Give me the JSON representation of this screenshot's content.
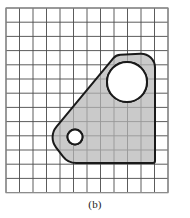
{
  "figure": {
    "caption": "(b)",
    "background_color": "#ffffff",
    "grid": {
      "origin_x": 6,
      "origin_y": 8,
      "cell_width": 13.5,
      "cell_height": 14.2,
      "columns": 12,
      "rows": 13,
      "line_color": "#4a4a4a",
      "line_width": 0.9,
      "border_color": "#8c8c8c",
      "border_width": 1.2
    },
    "part": {
      "name": "bracket-outline",
      "fill_color": "#b5b5b5",
      "fill_opacity": 0.72,
      "stroke_color": "#1a1a1a",
      "stroke_width": 2.0,
      "vertices": [
        {
          "x": 155,
          "y": 53
        },
        {
          "x": 155,
          "y": 163
        },
        {
          "x": 68,
          "y": 163
        },
        {
          "x": 48,
          "y": 137
        },
        {
          "x": 116,
          "y": 55
        }
      ],
      "top_right_fillet_radius": 14,
      "top_left_fillet_radius": 10,
      "left_nose_radius": 26,
      "bottom_left_fillet_radius": 18,
      "description": "Trapezoidal bracket plate with diagonal upper-left edge, rounded left nose, horizontal bottom edge and vertical right edge"
    },
    "holes": [
      {
        "name": "large-hole",
        "center_x": 127,
        "center_y": 82,
        "radius": 20,
        "fill_color": "#ffffff",
        "stroke_color": "#1a1a1a",
        "stroke_width": 2.0
      },
      {
        "name": "small-hole",
        "center_x": 75,
        "center_y": 137,
        "radius": 7.5,
        "fill_color": "#ffffff",
        "stroke_color": "#1a1a1a",
        "stroke_width": 2.0
      }
    ]
  }
}
